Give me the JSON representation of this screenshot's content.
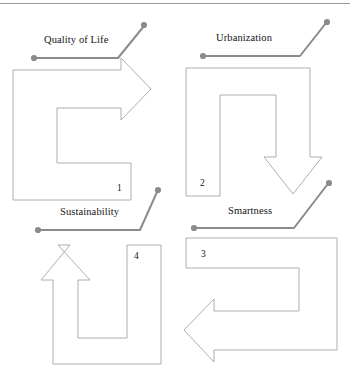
{
  "figure": {
    "title_rule": "horizontal-divider",
    "background_color": "#ffffff",
    "shape_stroke_color": "#9a9a9a",
    "leader_color": "#8b8b8b",
    "text_color": "#141414"
  },
  "quadrants": [
    {
      "id": "quadrant-top-left",
      "label": "Quality of Life",
      "number": "1",
      "arrow_direction": "right",
      "shape": "c-shaped-arrow"
    },
    {
      "id": "quadrant-top-right",
      "label": "Urbanization",
      "number": "2",
      "arrow_direction": "down",
      "shape": "inverted-u-arrow"
    },
    {
      "id": "quadrant-bottom-left",
      "label": "Sustainability",
      "number": "4",
      "arrow_direction": "up",
      "shape": "u-shaped-arrow"
    },
    {
      "id": "quadrant-bottom-right",
      "label": "Smartness",
      "number": "3",
      "arrow_direction": "left",
      "shape": "c-shaped-arrow-reversed"
    }
  ]
}
